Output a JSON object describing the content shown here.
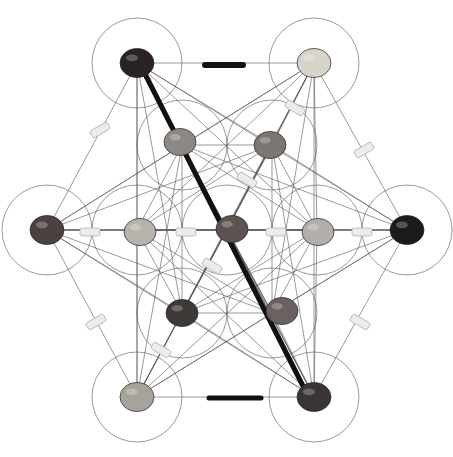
{
  "image": {
    "subject": "Metatron's Cube crystal grid",
    "background": "#ffffff",
    "line_color": "#555555",
    "circle_radius": 45,
    "center": [
      227,
      230
    ],
    "outer_nodes": [
      {
        "name": "top-left",
        "x": 137,
        "y": 63,
        "stone": "dark-tumbled",
        "color": "#2a2226"
      },
      {
        "name": "top-right",
        "x": 314,
        "y": 63,
        "stone": "pale-agate",
        "color": "#d8d4cc"
      },
      {
        "name": "left",
        "x": 47,
        "y": 230,
        "stone": "rough-dark",
        "color": "#4a4240"
      },
      {
        "name": "right",
        "x": 407,
        "y": 230,
        "stone": "black-tumbled",
        "color": "#1c1a1a"
      },
      {
        "name": "bottom-left",
        "x": 137,
        "y": 397,
        "stone": "calcite-block",
        "color": "#a8a29c"
      },
      {
        "name": "bottom-right",
        "x": 314,
        "y": 397,
        "stone": "black-tourmaline",
        "color": "#3a3434"
      }
    ],
    "inner_nodes": [
      {
        "name": "inner-top-left",
        "x": 180,
        "y": 142,
        "stone": "agate",
        "color": "#8e8884"
      },
      {
        "name": "inner-top-right",
        "x": 270,
        "y": 145,
        "stone": "agate",
        "color": "#7c7672"
      },
      {
        "name": "inner-left",
        "x": 140,
        "y": 232,
        "stone": "agate-slice",
        "color": "#b8b2ac"
      },
      {
        "name": "center",
        "x": 232,
        "y": 229,
        "stone": "jasper",
        "color": "#5c5450"
      },
      {
        "name": "inner-right",
        "x": 318,
        "y": 232,
        "stone": "agate",
        "color": "#b4aeaa"
      },
      {
        "name": "inner-bottom-left",
        "x": 182,
        "y": 313,
        "stone": "tumbled",
        "color": "#3e3836"
      },
      {
        "name": "inner-bottom-right",
        "x": 282,
        "y": 311,
        "stone": "tumbled",
        "color": "#6a6260"
      }
    ],
    "wands": [
      {
        "x1": 141,
        "y1": 66,
        "x2": 306,
        "y2": 392,
        "w": 5,
        "color": "#111111"
      },
      {
        "x1": 205,
        "y1": 65,
        "x2": 243,
        "y2": 65,
        "w": 6,
        "color": "#111111"
      },
      {
        "x1": 209,
        "y1": 398,
        "x2": 261,
        "y2": 398,
        "w": 5,
        "color": "#111111"
      }
    ],
    "points": [
      {
        "x": 100,
        "y": 130,
        "a": 60
      },
      {
        "x": 295,
        "y": 108,
        "a": -60
      },
      {
        "x": 364,
        "y": 150,
        "a": 60
      },
      {
        "x": 247,
        "y": 180,
        "a": -60
      },
      {
        "x": 212,
        "y": 266,
        "a": -60
      },
      {
        "x": 96,
        "y": 322,
        "a": 60
      },
      {
        "x": 161,
        "y": 350,
        "a": -60
      },
      {
        "x": 360,
        "y": 322,
        "a": -60
      },
      {
        "x": 90,
        "y": 232,
        "a": 0
      },
      {
        "x": 186,
        "y": 232,
        "a": 0
      },
      {
        "x": 276,
        "y": 232,
        "a": 0
      },
      {
        "x": 362,
        "y": 232,
        "a": 0
      }
    ]
  }
}
